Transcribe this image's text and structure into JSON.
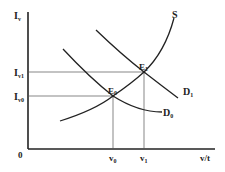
{
  "diagram": {
    "type": "supply-demand",
    "y_axis_label": "I",
    "y_axis_sub": "v",
    "x_axis_label": "v/t",
    "origin_label": "0",
    "y_ticks": [
      {
        "main": "I",
        "sub": "v1"
      },
      {
        "main": "I",
        "sub": "v0"
      }
    ],
    "x_ticks": [
      {
        "main": "v",
        "sub": "0"
      },
      {
        "main": "v",
        "sub": "1"
      }
    ],
    "curves": {
      "supply": "S",
      "demand0_main": "D",
      "demand0_sub": "0",
      "demand1_main": "D",
      "demand1_sub": "1"
    },
    "points": {
      "e0_main": "E",
      "e0_sub": "0",
      "e1_main": "E",
      "e1_sub": "1"
    },
    "colors": {
      "line": "#222222",
      "guide": "#555555"
    }
  }
}
